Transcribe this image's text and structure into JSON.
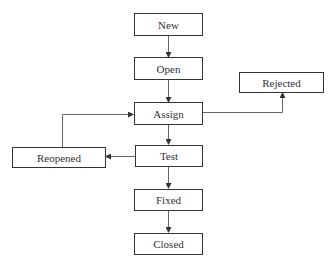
{
  "diagram": {
    "type": "flowchart",
    "title": "",
    "nodes": [
      {
        "id": "new",
        "label": "New"
      },
      {
        "id": "open",
        "label": "Open"
      },
      {
        "id": "assign",
        "label": "Assign"
      },
      {
        "id": "test",
        "label": "Test"
      },
      {
        "id": "fixed",
        "label": "Fixed"
      },
      {
        "id": "closed",
        "label": "Closed"
      },
      {
        "id": "rejected",
        "label": "Rejected"
      },
      {
        "id": "reopened",
        "label": "Reopened"
      }
    ],
    "edges": [
      {
        "from": "new",
        "to": "open"
      },
      {
        "from": "open",
        "to": "assign"
      },
      {
        "from": "assign",
        "to": "test"
      },
      {
        "from": "test",
        "to": "fixed"
      },
      {
        "from": "fixed",
        "to": "closed"
      },
      {
        "from": "assign",
        "to": "rejected"
      },
      {
        "from": "test",
        "to": "reopened"
      },
      {
        "from": "reopened",
        "to": "assign"
      }
    ],
    "colors": {
      "stroke": "#333333",
      "edge": "#555555",
      "text": "#333333"
    }
  }
}
